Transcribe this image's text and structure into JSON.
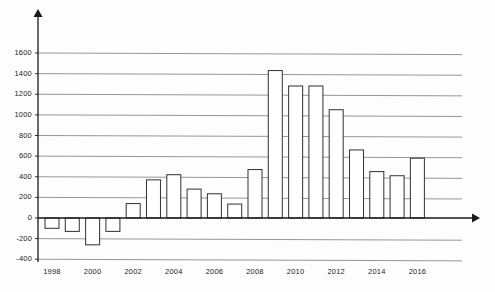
{
  "chart_data": {
    "type": "bar",
    "title": "",
    "subtitle": "",
    "xlabel": "",
    "ylabel": "",
    "categories": [
      1998,
      1999,
      2000,
      2001,
      2002,
      2003,
      2004,
      2005,
      2006,
      2007,
      2008,
      2009,
      2010,
      2011,
      2012,
      2013,
      2014,
      2015,
      2016
    ],
    "values": [
      -100,
      -130,
      -260,
      -130,
      140,
      370,
      420,
      280,
      235,
      135,
      470,
      1430,
      1280,
      1280,
      1050,
      660,
      450,
      410,
      580
    ],
    "series": [
      {
        "name": "",
        "values": [
          -100,
          -130,
          -260,
          -130,
          140,
          370,
          420,
          280,
          235,
          135,
          470,
          1430,
          1280,
          1280,
          1050,
          660,
          450,
          410,
          580
        ]
      }
    ],
    "ylim": [
      -400,
      1700
    ],
    "ytick_values": [
      1600,
      1400,
      1200,
      1000,
      800,
      600,
      400,
      200,
      0,
      -200,
      -400
    ],
    "ytick_labels": [
      "1600",
      "1400",
      "1200",
      "1000",
      "800",
      "600",
      "400",
      "200",
      "0",
      "-200",
      "-400"
    ],
    "xtick_labels": [
      "1998",
      "2000",
      "2002",
      "2004",
      "2006",
      "2008",
      "2010",
      "2012",
      "2014",
      "2016"
    ],
    "xtick_values": [
      1998,
      2000,
      2002,
      2004,
      2006,
      2008,
      2010,
      2012,
      2014,
      2016
    ],
    "grid": true,
    "grid_axis": "y",
    "legend": false,
    "legend_position": "none",
    "bar_fill_color": "#ffffff",
    "bar_edge_color": "#3a3a3a",
    "grid_color": "#8a8a8a",
    "axis_color": "#1a1a1a",
    "text_color": "#1b1b1b",
    "background_color": "#fdfdfd",
    "axis_arrows": true,
    "annotations": []
  }
}
